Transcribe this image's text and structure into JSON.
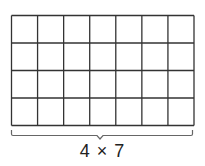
{
  "diagram": {
    "type": "array-grid",
    "rows": 4,
    "columns": 7,
    "label": "4 × 7",
    "line_color": "#333333",
    "brace_color": "#666666",
    "label_color": "#222222",
    "background": "#ffffff"
  }
}
